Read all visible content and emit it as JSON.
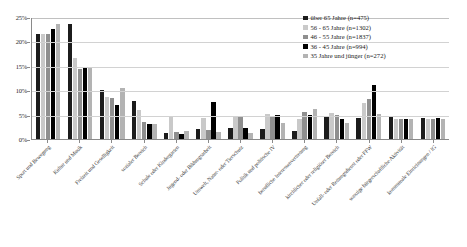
{
  "chart_data": {
    "type": "bar",
    "title": "",
    "xlabel": "",
    "ylabel": "",
    "ylim": [
      0,
      25
    ],
    "grid": true,
    "legend_position": "top-right",
    "ytick_labels": [
      "25%",
      "20%",
      "15%",
      "10%",
      "5%",
      "0%"
    ],
    "ytick_values": [
      25,
      20,
      15,
      10,
      5,
      0
    ],
    "categories": [
      "Sport und Bewegung",
      "Kultur und Musik",
      "Freizeit und Geselligkeit",
      "sozialer Bereich",
      "Schule oder Kindergarten",
      "Jugend- oder Bildungsarbeit",
      "Umwelt, Natur- oder Tierschutz",
      "Politik und politische IV",
      "berufliche Interessenvertretung",
      "kirchlicher oder religiöser Bereich",
      "Unfall- oder Rettungsdienst oder FFW",
      "sonstige bürgerschaftliche Aktivität",
      "kommunale Einrichtungen / IG"
    ],
    "series": [
      {
        "name": "über 65 Jahre (n=475)",
        "color": "#1c1c1c",
        "values": [
          21.5,
          23.5,
          10.0,
          7.8,
          1.3,
          2.0,
          2.2,
          2.0,
          1.6,
          4.6,
          4.3,
          4.5,
          4.3
        ]
      },
      {
        "name": "56 - 65 Jahre (n=1302)",
        "color": "#c9c9c9",
        "values": [
          21.5,
          16.5,
          8.7,
          6.0,
          4.6,
          4.3,
          4.8,
          5.1,
          4.2,
          5.3,
          7.3,
          4.2,
          4.2
        ]
      },
      {
        "name": "46 - 55 Jahre (n=1837)",
        "color": "#8f8f8f",
        "values": [
          21.5,
          14.3,
          8.5,
          3.5,
          1.5,
          1.8,
          4.6,
          4.6,
          5.6,
          5.0,
          8.2,
          4.1,
          4.1
        ]
      },
      {
        "name": "36 - 45 Jahre (n=994)",
        "color": "#000000",
        "values": [
          22.5,
          14.5,
          7.0,
          3.0,
          1.0,
          7.5,
          2.3,
          5.0,
          5.0,
          4.2,
          11.0,
          4.2,
          4.3
        ]
      },
      {
        "name": "35 Jahre und jünger (n=272)",
        "color": "#b3b3b3",
        "values": [
          23.5,
          14.5,
          10.5,
          3.0,
          1.7,
          1.5,
          1.2,
          3.2,
          6.1,
          3.3,
          5.2,
          4.0,
          4.0
        ]
      }
    ]
  }
}
